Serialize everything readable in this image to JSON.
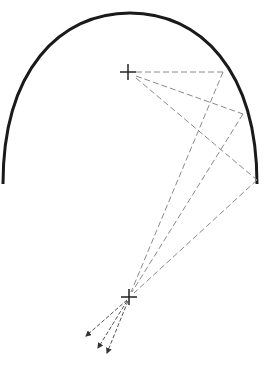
{
  "diagram": {
    "colors": {
      "mirror": "#1a1a1a",
      "ray": "#8a8a8a",
      "focus": "#222222",
      "background": "#ffffff"
    },
    "mirror": {
      "left_end": [
        3,
        184
      ],
      "apex": [
        130,
        13
      ],
      "right_end": [
        257,
        184
      ]
    },
    "focus_upper": [
      128,
      72
    ],
    "focus_lower": [
      129,
      297
    ],
    "reflection_points": [
      [
        223,
        72
      ],
      [
        243,
        114
      ],
      [
        257,
        180
      ]
    ],
    "arrow_tips": [
      [
        86,
        336
      ],
      [
        98,
        348
      ],
      [
        107,
        353
      ]
    ]
  }
}
